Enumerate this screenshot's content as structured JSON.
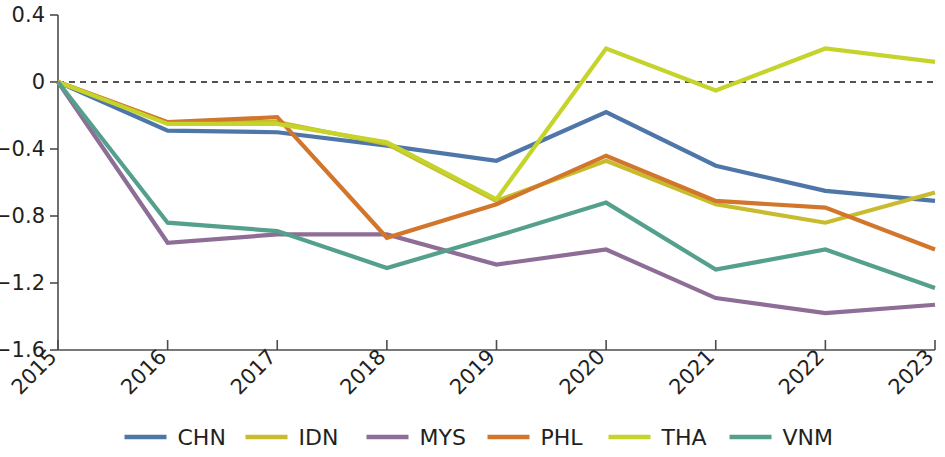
{
  "chart_data": {
    "type": "line",
    "title": "",
    "subtitle": "",
    "xlabel": "",
    "ylabel": "",
    "categories": [
      "2015",
      "2016",
      "2017",
      "2018",
      "2019",
      "2020",
      "2021",
      "2022",
      "2023"
    ],
    "x": [
      2015,
      2016,
      2017,
      2018,
      2019,
      2020,
      2021,
      2022,
      2023
    ],
    "xlim": [
      2015,
      2023
    ],
    "ylim": [
      -1.6,
      0.4
    ],
    "y_ticks": [
      0.4,
      0,
      -0.4,
      -0.8,
      -1.2,
      -1.6
    ],
    "y_tick_labels": [
      "0.4",
      "0",
      "−0.4",
      "−0.8",
      "−1.2",
      "−1.6"
    ],
    "grid": false,
    "legend_position": "bottom",
    "reference_line": {
      "value": 0,
      "style": "dashed",
      "color": "#1a1a1a"
    },
    "series": [
      {
        "name": "CHN",
        "color": "#4f76a8",
        "values": [
          0,
          -0.29,
          -0.3,
          -0.38,
          -0.47,
          -0.18,
          -0.5,
          -0.65,
          -0.71
        ]
      },
      {
        "name": "IDN",
        "color": "#c8bc2e",
        "values": [
          0,
          -0.24,
          -0.24,
          -0.37,
          -0.71,
          -0.47,
          -0.73,
          -0.84,
          -0.66
        ]
      },
      {
        "name": "MYS",
        "color": "#8e6e96",
        "values": [
          0,
          -0.96,
          -0.91,
          -0.91,
          -1.09,
          -1.0,
          -1.29,
          -1.38,
          -1.33
        ]
      },
      {
        "name": "PHL",
        "color": "#d2762c",
        "values": [
          0,
          -0.24,
          -0.21,
          -0.93,
          -0.73,
          -0.44,
          -0.71,
          -0.75,
          -1.0
        ]
      },
      {
        "name": "THA",
        "color": "#c5d42a",
        "values": [
          0,
          -0.25,
          -0.25,
          -0.36,
          -0.7,
          0.2,
          -0.05,
          0.2,
          0.12
        ]
      },
      {
        "name": "VNM",
        "color": "#54a08c",
        "values": [
          0,
          -0.84,
          -0.89,
          -1.11,
          -0.92,
          -0.72,
          -1.12,
          -1.0,
          -1.23
        ]
      }
    ]
  },
  "legend": {
    "entries": [
      {
        "label": "CHN",
        "color": "#4f76a8"
      },
      {
        "label": "IDN",
        "color": "#c8bc2e"
      },
      {
        "label": "MYS",
        "color": "#8e6e96"
      },
      {
        "label": "PHL",
        "color": "#d2762c"
      },
      {
        "label": "THA",
        "color": "#c5d42a"
      },
      {
        "label": "VNM",
        "color": "#54a08c"
      }
    ]
  },
  "axes": {
    "y_tick_labels": [
      "0.4",
      "0",
      "−0.4",
      "−0.8",
      "−1.2",
      "−1.6"
    ],
    "x_tick_labels": [
      "2015",
      "2016",
      "2017",
      "2018",
      "2019",
      "2020",
      "2021",
      "2022",
      "2023"
    ]
  }
}
